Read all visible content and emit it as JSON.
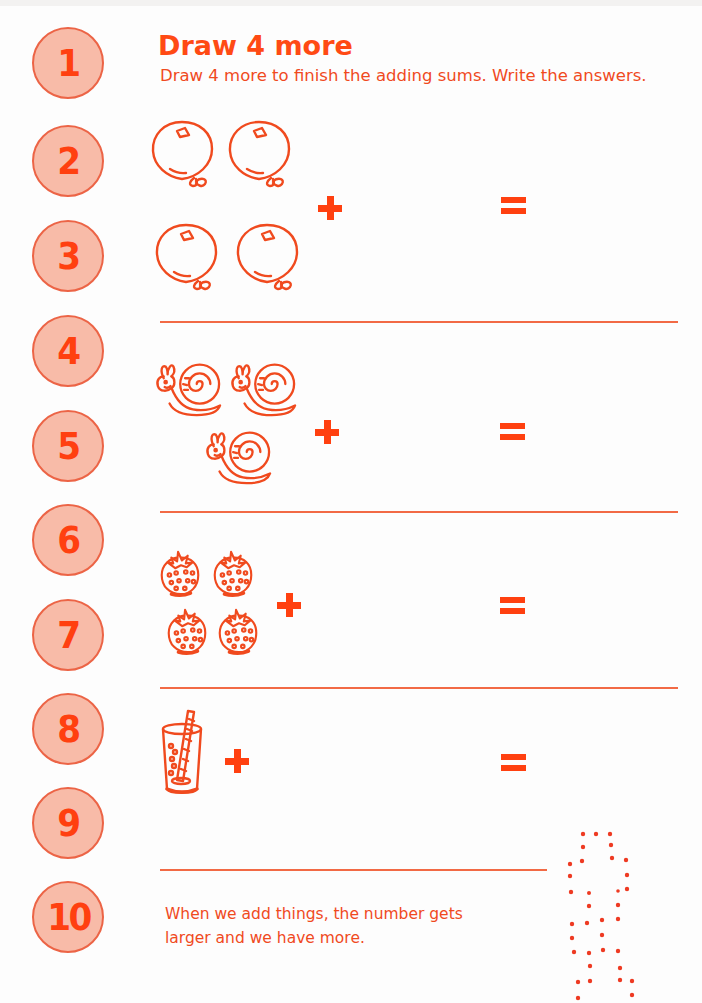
{
  "page": {
    "title": "Draw 4 more",
    "instructions": "Draw 4 more to finish the adding sums. Write the answers.",
    "footer_line1": "When we add things, the number gets",
    "footer_line2": "larger and we have more."
  },
  "number_track": [
    "1",
    "2",
    "3",
    "4",
    "5",
    "6",
    "7",
    "8",
    "9",
    "10"
  ],
  "sums": [
    {
      "item": "balloon-icon",
      "count": 4,
      "operator": "+",
      "equals": "="
    },
    {
      "item": "snail-icon",
      "count": 3,
      "operator": "+",
      "equals": "="
    },
    {
      "item": "strawberry-icon",
      "count": 4,
      "operator": "+",
      "equals": "="
    },
    {
      "item": "glass-with-straw-icon",
      "count": 1,
      "operator": "+",
      "equals": "="
    }
  ],
  "colors": {
    "accent": "#ff4a14",
    "circle_fill": "#f8bba8",
    "circle_border": "#ec6446",
    "rule": "#f26a45"
  }
}
